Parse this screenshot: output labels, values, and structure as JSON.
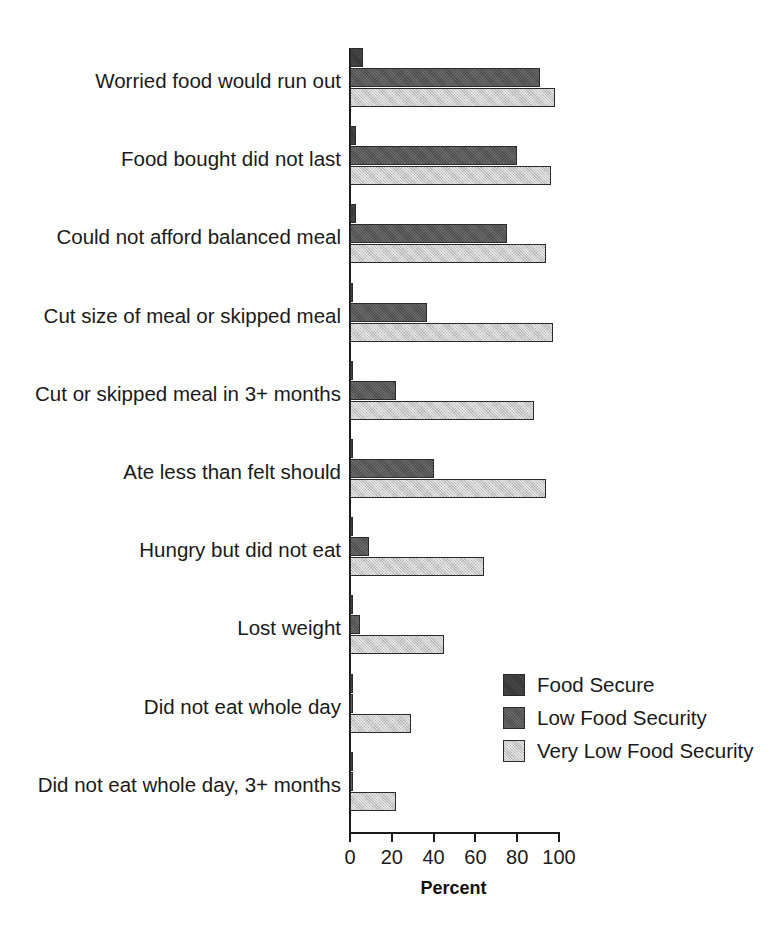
{
  "chart_data": {
    "type": "bar",
    "orientation": "horizontal",
    "title": "",
    "xlabel": "Percent",
    "ylabel": "",
    "xlim": [
      0,
      100
    ],
    "xticks": [
      0,
      20,
      40,
      60,
      80,
      100
    ],
    "xtick_labels": [
      "0",
      "20",
      "40",
      "60",
      "80",
      "100"
    ],
    "grid": false,
    "legend_position": "inside-lower-right",
    "categories": [
      "Worried food would run out",
      "Food bought did not last",
      "Could not afford balanced meal",
      "Cut size of meal or skipped meal",
      "Cut or skipped meal in 3+ months",
      "Ate less than felt should",
      "Hungry but did not eat",
      "Lost weight",
      "Did not eat whole day",
      "Did not eat whole day, 3+ months"
    ],
    "series": [
      {
        "name": "Food Secure",
        "color": "#343434",
        "values": [
          6,
          3,
          3,
          1,
          1,
          1,
          1,
          1,
          0.5,
          0.5
        ]
      },
      {
        "name": "Low Food Security",
        "color": "#555555",
        "values": [
          91,
          80,
          75,
          37,
          22,
          40,
          9,
          5,
          1,
          1
        ]
      },
      {
        "name": "Very Low Food Security",
        "color": "#c9c9c9",
        "values": [
          98,
          96,
          94,
          97,
          88,
          94,
          64,
          45,
          29,
          22
        ]
      }
    ]
  },
  "legend": {
    "entries": [
      {
        "label": "Food Secure"
      },
      {
        "label": "Low Food Security"
      },
      {
        "label": "Very Low Food Security"
      }
    ]
  }
}
